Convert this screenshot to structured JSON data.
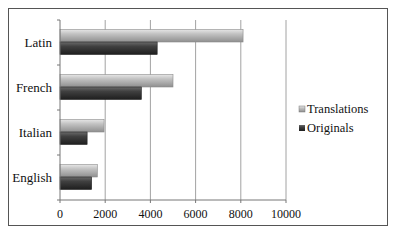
{
  "chart_data": {
    "type": "bar",
    "orientation": "horizontal",
    "title": "",
    "xlabel": "",
    "ylabel": "",
    "categories": [
      "Latin",
      "French",
      "Italian",
      "English"
    ],
    "series": [
      {
        "name": "Translations",
        "values": [
          8100,
          5000,
          1950,
          1650
        ],
        "color": "#b3b3b3"
      },
      {
        "name": "Originals",
        "values": [
          4300,
          3600,
          1200,
          1400
        ],
        "color": "#3b3b3b"
      }
    ],
    "xlim": [
      0,
      10000
    ],
    "xticks": [
      "0",
      "2000",
      "4000",
      "6000",
      "8000",
      "10000"
    ],
    "grid": "vertical",
    "legend_position": "right"
  },
  "legend": {
    "translations": "Translations",
    "originals": "Originals"
  }
}
